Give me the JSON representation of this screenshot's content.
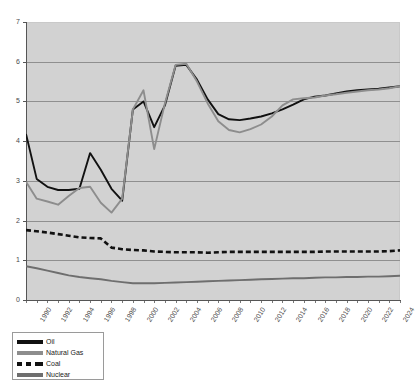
{
  "chart_data": {
    "type": "line",
    "title": "",
    "xlabel": "",
    "ylabel": "",
    "ylim": [
      0,
      7
    ],
    "yticks": [
      0,
      1,
      2,
      3,
      4,
      5,
      6,
      7
    ],
    "grid": true,
    "legend_position": "below-left",
    "plot_background": "#d2d2d2",
    "x": [
      1990,
      1991,
      1992,
      1993,
      1994,
      1995,
      1996,
      1997,
      1998,
      1999,
      2000,
      2001,
      2002,
      2003,
      2004,
      2005,
      2006,
      2007,
      2008,
      2009,
      2010,
      2011,
      2012,
      2013,
      2014,
      2015,
      2016,
      2017,
      2018,
      2019,
      2020,
      2021,
      2022,
      2023,
      2024,
      2025
    ],
    "xticks": [
      1990,
      1992,
      1994,
      1996,
      1998,
      2000,
      2002,
      2004,
      2006,
      2008,
      2010,
      2012,
      2014,
      2016,
      2018,
      2020,
      2022,
      2024
    ],
    "xtick_labels": [
      "1990",
      "1992",
      "1994",
      "1996",
      "1998",
      "2000",
      "2002",
      "2004",
      "2006",
      "2008",
      "2010",
      "2012",
      "2014",
      "2016",
      "2018",
      "2020",
      "2022",
      "2024"
    ],
    "series": [
      {
        "name": "Oil",
        "color": "#111111",
        "style": "solid",
        "values": [
          4.18,
          3.05,
          2.85,
          2.77,
          2.77,
          2.8,
          3.7,
          3.28,
          2.8,
          2.5,
          4.8,
          5.0,
          4.35,
          4.9,
          5.9,
          5.92,
          5.55,
          5.05,
          4.68,
          4.55,
          4.53,
          4.57,
          4.62,
          4.7,
          4.8,
          4.92,
          5.05,
          5.12,
          5.15,
          5.2,
          5.25,
          5.28,
          5.3,
          5.32,
          5.35,
          5.38
        ]
      },
      {
        "name": "Natural Gas",
        "color": "#8d8d8d",
        "style": "solid",
        "values": [
          2.98,
          2.55,
          2.48,
          2.4,
          2.62,
          2.82,
          2.85,
          2.45,
          2.2,
          2.55,
          4.8,
          5.28,
          3.8,
          4.95,
          5.92,
          5.95,
          5.5,
          4.95,
          4.5,
          4.28,
          4.22,
          4.3,
          4.42,
          4.62,
          4.9,
          5.05,
          5.08,
          5.1,
          5.15,
          5.18,
          5.22,
          5.25,
          5.28,
          5.3,
          5.33,
          5.38
        ]
      },
      {
        "name": "Coal",
        "color": "#111111",
        "style": "dashed",
        "values": [
          1.76,
          1.73,
          1.7,
          1.66,
          1.62,
          1.58,
          1.56,
          1.55,
          1.32,
          1.28,
          1.26,
          1.25,
          1.22,
          1.21,
          1.2,
          1.2,
          1.2,
          1.19,
          1.2,
          1.21,
          1.21,
          1.21,
          1.21,
          1.21,
          1.21,
          1.21,
          1.21,
          1.21,
          1.22,
          1.22,
          1.22,
          1.22,
          1.22,
          1.22,
          1.23,
          1.25
        ]
      },
      {
        "name": "Nuclear",
        "color": "#6e6e6e",
        "style": "solid",
        "values": [
          0.85,
          0.8,
          0.74,
          0.68,
          0.62,
          0.58,
          0.55,
          0.52,
          0.48,
          0.45,
          0.42,
          0.42,
          0.42,
          0.43,
          0.44,
          0.45,
          0.46,
          0.47,
          0.48,
          0.49,
          0.5,
          0.51,
          0.52,
          0.53,
          0.54,
          0.55,
          0.55,
          0.56,
          0.57,
          0.57,
          0.58,
          0.58,
          0.59,
          0.59,
          0.6,
          0.61
        ]
      }
    ]
  },
  "legend": {
    "items": [
      {
        "label": "Oil",
        "swatch": "oil"
      },
      {
        "label": "Natural Gas",
        "swatch": "gas"
      },
      {
        "label": "Coal",
        "swatch": "coal"
      },
      {
        "label": "Nuclear",
        "swatch": "nuc"
      }
    ]
  }
}
